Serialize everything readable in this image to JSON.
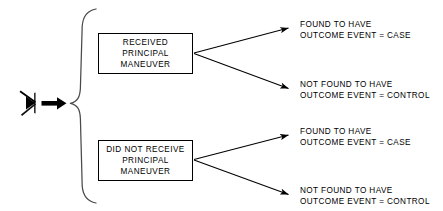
{
  "diagram": {
    "type": "tree-flow-diagram",
    "entry": {
      "source_icon": "arrowhead-left-glyph",
      "flow_icon": "bold-right-arrow-icon",
      "brace_icon": "large-curly-brace-icon"
    },
    "branches": [
      {
        "id": "received",
        "box": {
          "lines": [
            "RECEIVED",
            "PRINCIPAL",
            "MANEUVER"
          ]
        },
        "outcomes": [
          {
            "id": "received-case",
            "lines": [
              "FOUND TO HAVE",
              "OUTCOME EVENT = CASE"
            ]
          },
          {
            "id": "received-control",
            "lines": [
              "NOT FOUND TO HAVE",
              "OUTCOME EVENT = CONTROL"
            ]
          }
        ]
      },
      {
        "id": "not-received",
        "box": {
          "lines": [
            "DID NOT RECEIVE",
            "PRINCIPAL",
            "MANEUVER"
          ]
        },
        "outcomes": [
          {
            "id": "not-received-case",
            "lines": [
              "FOUND TO HAVE",
              "OUTCOME EVENT = CASE"
            ]
          },
          {
            "id": "not-received-control",
            "lines": [
              "NOT FOUND TO HAVE",
              "OUTCOME EVENT = CONTROL"
            ]
          }
        ]
      }
    ],
    "colors": {
      "stroke": "#000000",
      "background": "#ffffff",
      "text": "#000000"
    }
  }
}
